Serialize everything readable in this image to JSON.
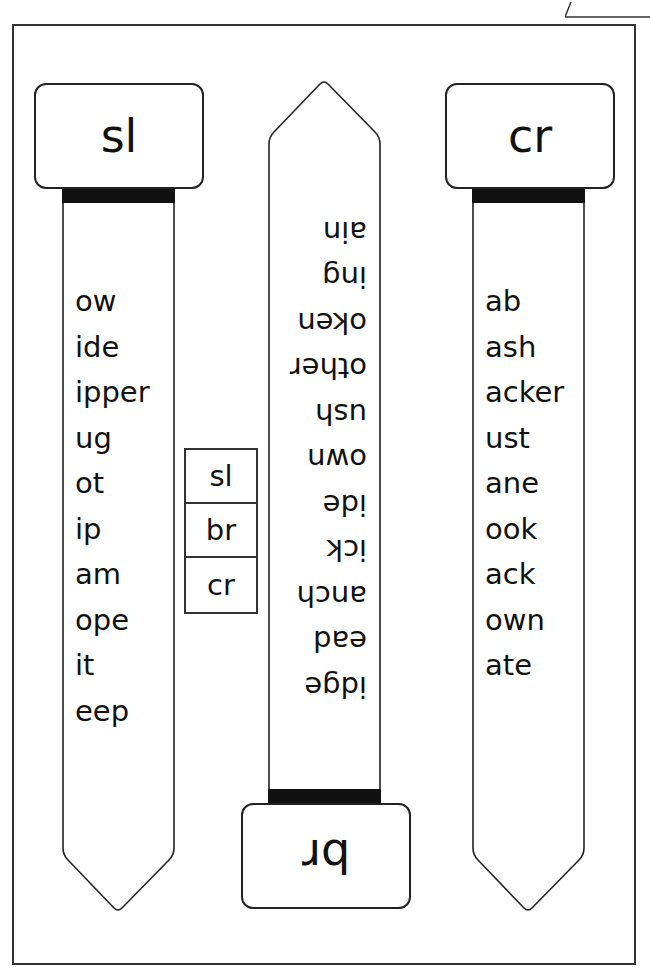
{
  "worksheet": {
    "title": "Consonant blend word slider strips",
    "strips": [
      {
        "id": "sl",
        "blend": "sl",
        "orientation": "upright",
        "endings": [
          "ow",
          "ide",
          "ipper",
          "ug",
          "ot",
          "ip",
          "am",
          "ope",
          "it",
          "eep"
        ]
      },
      {
        "id": "br",
        "blend": "br",
        "orientation": "upside-down",
        "endings": [
          "idge",
          "ead",
          "anch",
          "ick",
          "ide",
          "own",
          "ush",
          "other",
          "oken",
          "ing",
          "ain"
        ]
      },
      {
        "id": "cr",
        "blend": "cr",
        "orientation": "upright",
        "endings": [
          "ab",
          "ash",
          "acker",
          "ust",
          "ane",
          "ook",
          "ack",
          "own",
          "ate"
        ]
      }
    ],
    "key_table": [
      "sl",
      "br",
      "cr"
    ],
    "colors": {
      "ink": "#111111",
      "border": "#333333",
      "band": "#111111",
      "paper": "#ffffff"
    }
  }
}
